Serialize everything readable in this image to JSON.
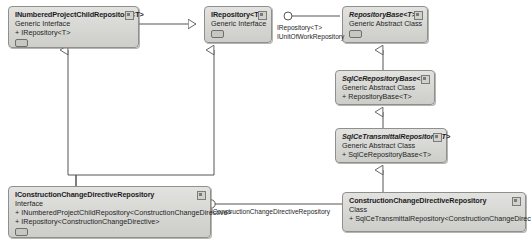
{
  "diagram": {
    "kind": "uml-class-diagram",
    "width": 531,
    "height": 241,
    "background": "#ffffff",
    "node_fill": "#d8d8d5",
    "node_border": "#8f8f8c",
    "edge_color": "#555553"
  },
  "nodes": {
    "inumbered_project_child_repository": {
      "title": "INumberedProjectChildRepository<T>",
      "stereotype": "Generic Interface",
      "members": [
        "+ IRepository<T>"
      ]
    },
    "irepository": {
      "title": "IRepository<T>",
      "stereotype": "Generic Interface",
      "members": []
    },
    "repository_base": {
      "title": "RepositoryBase<T>",
      "stereotype": "Generic Abstract Class",
      "members": []
    },
    "sqlce_repository_base": {
      "title": "SqlCeRepositoryBase<T>",
      "stereotype": "Generic Abstract Class",
      "members": [
        "+ RepositoryBase<T>"
      ]
    },
    "sqlce_transmittal_repository": {
      "title": "SqlCeTransmittalRepository<T>",
      "stereotype": "Generic Abstract Class",
      "members": [
        "+ SqlCeRepositoryBase<T>"
      ]
    },
    "iconstruction_change_directive_repository": {
      "title": "IConstructionChangeDirectiveRepository",
      "stereotype": "Interface",
      "members": [
        "+ INumberedProjectChildRepository<ConstructionChangeDirective>",
        "+ IRepository<ConstructionChangeDirective>"
      ]
    },
    "construction_change_directive_repository": {
      "title": "ConstructionChangeDirectiveRepository",
      "stereotype": "Class",
      "members": [
        "+ SqlCeTransmittalRepository<ConstructionChangeDirective>"
      ]
    }
  },
  "edge_labels": {
    "irepository_lollipop_line1": "IRepository<T>",
    "irepository_lollipop_line2": "IUnitOfWorkRepository",
    "iccd_lollipop": "IConstructionChangeDirectiveRepository"
  }
}
